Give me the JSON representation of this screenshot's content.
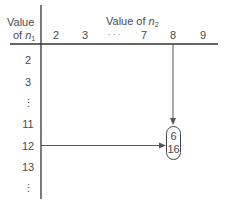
{
  "table": {
    "row_header": {
      "line1": "Value",
      "line2_prefix": "of ",
      "var": "n",
      "sub": "1"
    },
    "col_header": {
      "prefix": "Value of ",
      "var": "n",
      "sub": "2"
    },
    "columns": [
      "2",
      "3",
      "· · ·",
      "7",
      "8",
      "9"
    ],
    "rows": [
      "2",
      "3",
      "⋮",
      "11",
      "12",
      "13",
      "⋮"
    ],
    "highlight": {
      "row": "12",
      "column": "8",
      "values": [
        "6",
        "16"
      ]
    }
  },
  "colors": {
    "line": "#555555",
    "text": "#4a4a4a"
  }
}
